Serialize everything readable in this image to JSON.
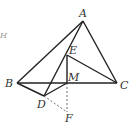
{
  "diagram": {
    "type": "geometry",
    "points": {
      "A": {
        "x": 83,
        "y": 21,
        "label": "A"
      },
      "B": {
        "x": 17,
        "y": 83,
        "label": "B"
      },
      "C": {
        "x": 117,
        "y": 83,
        "label": "C"
      },
      "D": {
        "x": 44,
        "y": 96,
        "label": "D"
      },
      "E": {
        "x": 67,
        "y": 55,
        "label": "E"
      },
      "M": {
        "x": 67,
        "y": 83,
        "label": "M"
      },
      "F": {
        "x": 67,
        "y": 112,
        "label": "F"
      }
    },
    "solid_segments": [
      "AB",
      "AC",
      "BC",
      "AD",
      "EC",
      "EM",
      "BD",
      "DM"
    ],
    "dashed_segments": [
      "DF",
      "MF"
    ],
    "stray_label": "H",
    "line_color": "#222222"
  }
}
